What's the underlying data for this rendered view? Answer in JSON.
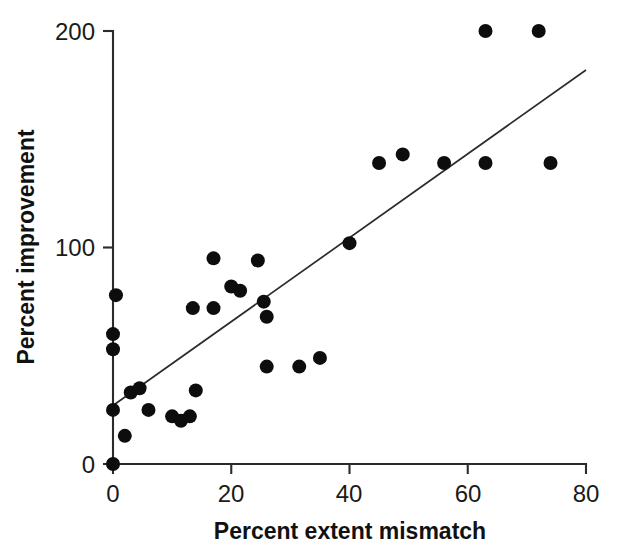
{
  "chart_data": {
    "type": "scatter",
    "title": "",
    "xlabel": "Percent extent mismatch",
    "ylabel": "Percent improvement",
    "xlim": [
      0,
      80
    ],
    "ylim": [
      0,
      200
    ],
    "xticks": [
      0,
      20,
      40,
      60,
      80
    ],
    "yticks": [
      0,
      100,
      200
    ],
    "xtick_labels": [
      "0",
      "20",
      "40",
      "60",
      "80"
    ],
    "ytick_labels": [
      "0",
      "100",
      "200"
    ],
    "grid": false,
    "legend": null,
    "marker": "filled-circle",
    "marker_color": "#0d0d0d",
    "marker_size": 9,
    "series": [
      {
        "name": "observations",
        "points": [
          [
            0,
            0
          ],
          [
            0,
            25
          ],
          [
            0,
            53
          ],
          [
            0,
            60
          ],
          [
            0.5,
            78
          ],
          [
            2,
            13
          ],
          [
            3,
            33
          ],
          [
            4.5,
            35
          ],
          [
            6,
            25
          ],
          [
            10,
            22
          ],
          [
            11.5,
            20
          ],
          [
            13,
            22
          ],
          [
            14,
            34
          ],
          [
            13.5,
            72
          ],
          [
            17,
            95
          ],
          [
            17,
            72
          ],
          [
            20,
            82
          ],
          [
            21.5,
            80
          ],
          [
            24.5,
            94
          ],
          [
            25.5,
            75
          ],
          [
            26,
            68
          ],
          [
            26,
            45
          ],
          [
            31.5,
            45
          ],
          [
            35,
            49
          ],
          [
            40,
            102
          ],
          [
            45,
            139
          ],
          [
            49,
            143
          ],
          [
            56,
            139
          ],
          [
            63,
            200
          ],
          [
            63,
            139
          ],
          [
            72,
            200
          ],
          [
            74,
            139
          ]
        ]
      }
    ],
    "fit_line": {
      "name": "linear regression",
      "x_start": 0,
      "y_start": 27,
      "x_end": 80,
      "y_end": 182,
      "color": "#2b2b2b"
    }
  },
  "axes": {
    "x_axis_label": "Percent extent mismatch",
    "y_axis_label": "Percent improvement"
  }
}
